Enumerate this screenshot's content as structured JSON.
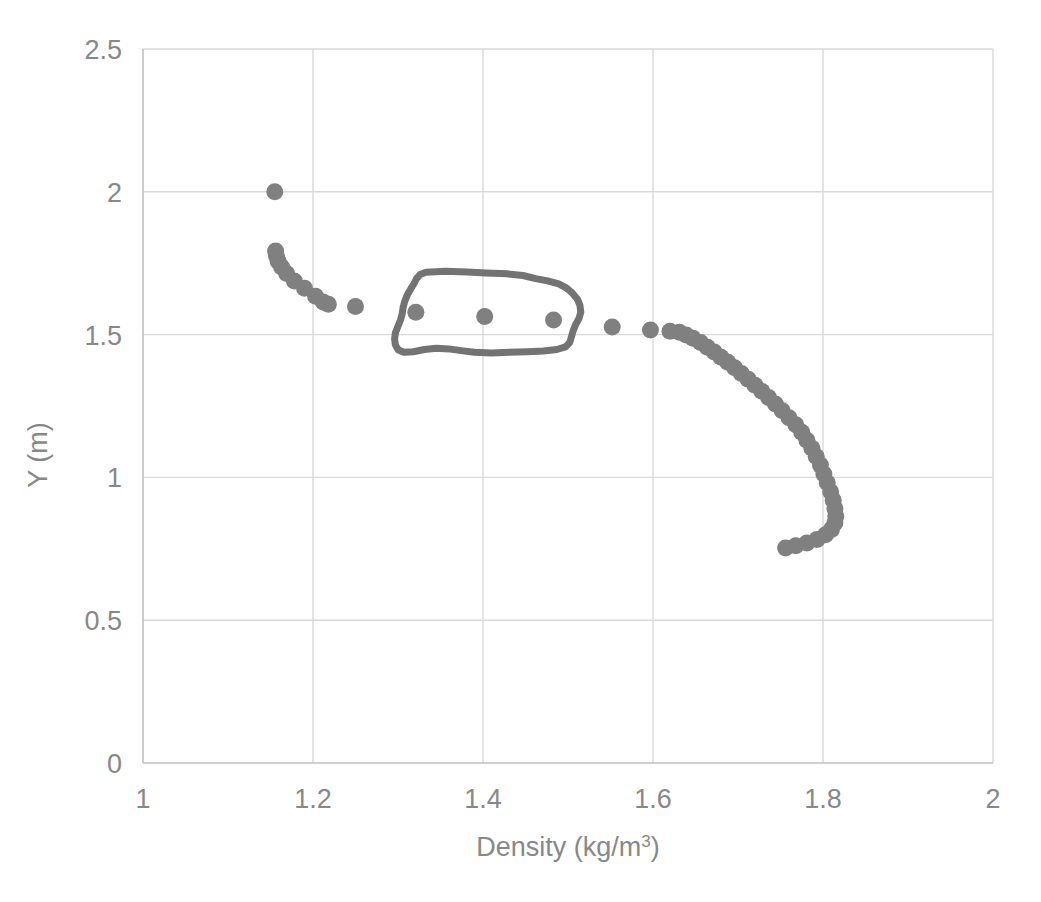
{
  "chart_data": {
    "type": "scatter",
    "title": "",
    "xlabel": "Density (kg/m³)",
    "ylabel": "Y (m)",
    "xlim": [
      1,
      2
    ],
    "ylim": [
      0,
      2.5
    ],
    "xticks": [
      "1",
      "1.2",
      "1.4",
      "1.6",
      "1.8",
      "2"
    ],
    "xtick_values": [
      1,
      1.2,
      1.4,
      1.6,
      1.8,
      2
    ],
    "yticks": [
      "0",
      "0.5",
      "1",
      "1.5",
      "2",
      "2.5"
    ],
    "ytick_values": [
      0,
      0.5,
      1,
      1.5,
      2,
      2.5
    ],
    "grid": true,
    "legend": "none",
    "marker_color": "#808080",
    "marker_size_px": 17,
    "gridline_color": "#d9d9d9",
    "axisline_color": "#bfbfbf",
    "background_color": "#ffffff",
    "series": [
      {
        "name": "Density profile",
        "points": [
          [
            1.155,
            2.0
          ],
          [
            1.156,
            1.793
          ],
          [
            1.157,
            1.776
          ],
          [
            1.159,
            1.757
          ],
          [
            1.163,
            1.737
          ],
          [
            1.169,
            1.714
          ],
          [
            1.178,
            1.688
          ],
          [
            1.19,
            1.662
          ],
          [
            1.203,
            1.634
          ],
          [
            1.212,
            1.614
          ],
          [
            1.218,
            1.606
          ],
          [
            1.25,
            1.598
          ],
          [
            1.321,
            1.578
          ],
          [
            1.402,
            1.563
          ],
          [
            1.483,
            1.551
          ],
          [
            1.552,
            1.527
          ],
          [
            1.597,
            1.516
          ],
          [
            1.62,
            1.512
          ],
          [
            1.631,
            1.508
          ],
          [
            1.639,
            1.499
          ],
          [
            1.647,
            1.487
          ],
          [
            1.656,
            1.472
          ],
          [
            1.664,
            1.456
          ],
          [
            1.672,
            1.439
          ],
          [
            1.68,
            1.421
          ],
          [
            1.688,
            1.403
          ],
          [
            1.696,
            1.384
          ],
          [
            1.704,
            1.364
          ],
          [
            1.712,
            1.344
          ],
          [
            1.72,
            1.323
          ],
          [
            1.728,
            1.302
          ],
          [
            1.736,
            1.28
          ],
          [
            1.744,
            1.257
          ],
          [
            1.752,
            1.233
          ],
          [
            1.76,
            1.209
          ],
          [
            1.768,
            1.184
          ],
          [
            1.775,
            1.158
          ],
          [
            1.781,
            1.13
          ],
          [
            1.787,
            1.102
          ],
          [
            1.792,
            1.073
          ],
          [
            1.797,
            1.043
          ],
          [
            1.801,
            1.012
          ],
          [
            1.805,
            0.981
          ],
          [
            1.809,
            0.95
          ],
          [
            1.812,
            0.92
          ],
          [
            1.814,
            0.891
          ],
          [
            1.815,
            0.864
          ],
          [
            1.814,
            0.84
          ],
          [
            1.81,
            0.818
          ],
          [
            1.803,
            0.799
          ],
          [
            1.793,
            0.783
          ],
          [
            1.781,
            0.77
          ],
          [
            1.768,
            0.761
          ],
          [
            1.756,
            0.753
          ]
        ]
      }
    ],
    "annotations": [
      {
        "type": "hand-drawn-oval",
        "label": "highlight-oval",
        "color": "#737373",
        "stroke_width_px": 7,
        "encloses_points": [
          [
            1.321,
            1.578
          ],
          [
            1.402,
            1.563
          ],
          [
            1.483,
            1.551
          ]
        ],
        "x_range": [
          1.296,
          1.515
        ],
        "y_range": [
          1.435,
          1.718
        ],
        "outline": [
          [
            1.333,
            1.718
          ],
          [
            1.356,
            1.722
          ],
          [
            1.381,
            1.719
          ],
          [
            1.404,
            1.716
          ],
          [
            1.428,
            1.713
          ],
          [
            1.447,
            1.707
          ],
          [
            1.462,
            1.696
          ],
          [
            1.476,
            1.688
          ],
          [
            1.489,
            1.678
          ],
          [
            1.498,
            1.664
          ],
          [
            1.505,
            1.646
          ],
          [
            1.511,
            1.625
          ],
          [
            1.514,
            1.603
          ],
          [
            1.515,
            1.579
          ],
          [
            1.513,
            1.556
          ],
          [
            1.509,
            1.535
          ],
          [
            1.506,
            1.513
          ],
          [
            1.504,
            1.492
          ],
          [
            1.502,
            1.472
          ],
          [
            1.497,
            1.457
          ],
          [
            1.487,
            1.448
          ],
          [
            1.471,
            1.443
          ],
          [
            1.452,
            1.44
          ],
          [
            1.431,
            1.438
          ],
          [
            1.41,
            1.436
          ],
          [
            1.39,
            1.438
          ],
          [
            1.374,
            1.444
          ],
          [
            1.36,
            1.45
          ],
          [
            1.345,
            1.452
          ],
          [
            1.331,
            1.448
          ],
          [
            1.318,
            1.44
          ],
          [
            1.307,
            1.438
          ],
          [
            1.3,
            1.447
          ],
          [
            1.297,
            1.464
          ],
          [
            1.296,
            1.484
          ],
          [
            1.297,
            1.506
          ],
          [
            1.3,
            1.529
          ],
          [
            1.303,
            1.551
          ],
          [
            1.305,
            1.573
          ],
          [
            1.306,
            1.595
          ],
          [
            1.308,
            1.617
          ],
          [
            1.311,
            1.639
          ],
          [
            1.315,
            1.66
          ],
          [
            1.319,
            1.679
          ],
          [
            1.322,
            1.697
          ],
          [
            1.326,
            1.71
          ],
          [
            1.333,
            1.718
          ]
        ]
      }
    ]
  },
  "axis": {
    "x_title": "Density (kg/m",
    "x_title_sup": "3",
    "x_title_tail": ")",
    "y_title": "Y (m)"
  }
}
